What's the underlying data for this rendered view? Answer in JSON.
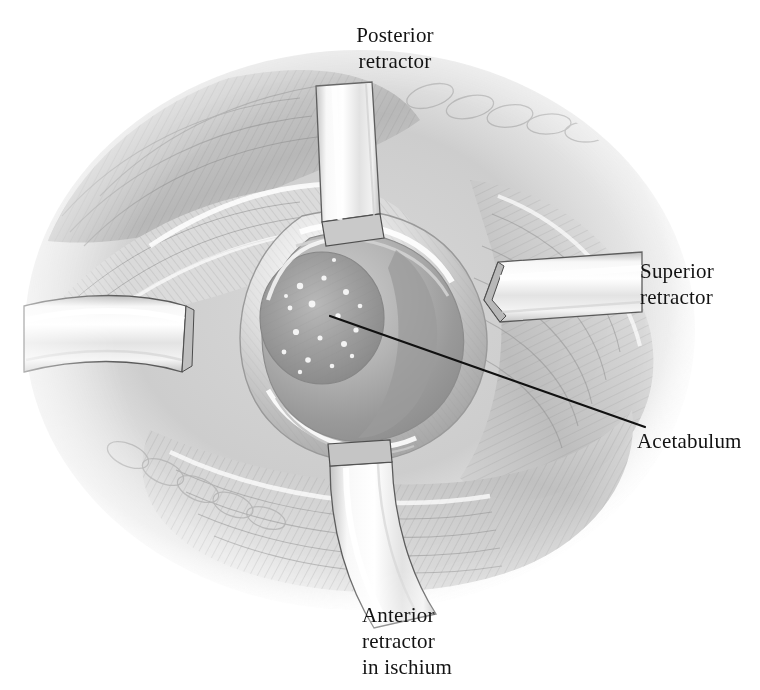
{
  "figure": {
    "medium": "grayscale pencil-and-wash surgical illustration",
    "background_color": "#ffffff",
    "ink_color": "#131313"
  },
  "labels": {
    "posterior_retractor": "Posterior\nretractor",
    "superior_retractor": "Superior\nretractor",
    "acetabulum": "Acetabulum",
    "anterior_retractor": "Anterior\nretractor\nin ischium"
  },
  "caption": {
    "text": "",
    "note": "clipped caption line at bottom edge — illegible"
  },
  "leader_lines": [
    {
      "name": "acetabulum-leader",
      "from": [
        330,
        316
      ],
      "to": [
        645,
        427
      ],
      "stroke": "#111111",
      "width": 2.2
    }
  ],
  "instruments": [
    {
      "name": "posterior-retractor",
      "position": "top-center",
      "orientation": "vertical band descending into wound",
      "metal_tone": "#e9e9e9"
    },
    {
      "name": "superior-retractor",
      "position": "right",
      "orientation": "horizontal band entering from right, tapered tip",
      "metal_tone": "#ededed"
    },
    {
      "name": "anterior-retractor",
      "position": "bottom-center",
      "orientation": "band curving down and left out of wound",
      "metal_tone": "#f0f0f0"
    },
    {
      "name": "lateral-retractor-unlabeled",
      "position": "left",
      "orientation": "horizontal band entering from left edge",
      "metal_tone": "#ececec"
    }
  ],
  "anatomy": [
    {
      "name": "acetabulum-rim",
      "description": "concentric bony bowl, center of field"
    },
    {
      "name": "acetabular-fossa",
      "description": "stippled inner fossa with light speckles"
    },
    {
      "name": "muscle-flaps",
      "description": "layered striated muscle and fascia, upper left"
    },
    {
      "name": "fat-lobules",
      "description": "chain of oval subcutaneous fat lobules along wound margin"
    },
    {
      "name": "wound-margin",
      "description": "soft-tissue edge ringing the exposure"
    }
  ]
}
